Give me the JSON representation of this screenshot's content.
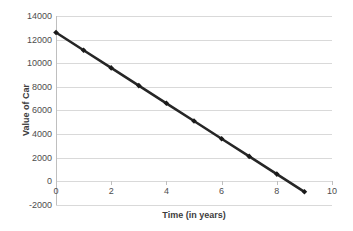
{
  "chart_data": {
    "type": "line",
    "title": "",
    "xlabel": "Time (in years)",
    "ylabel": "Value of Car",
    "x": [
      0,
      1,
      2,
      3,
      4,
      5,
      6,
      7,
      8,
      9
    ],
    "values": [
      12600,
      11100,
      9600,
      8100,
      6600,
      5100,
      3600,
      2100,
      600,
      -900
    ],
    "series": [
      {
        "name": "Value of Car",
        "x": [
          0,
          1,
          2,
          3,
          4,
          5,
          6,
          7,
          8,
          9
        ],
        "values": [
          12600,
          11100,
          9600,
          8100,
          6600,
          5100,
          3600,
          2100,
          600,
          -900
        ]
      }
    ],
    "xlim": [
      0,
      10
    ],
    "ylim": [
      -2000,
      14000
    ],
    "xticks": [
      0,
      2,
      4,
      6,
      8,
      10
    ],
    "yticks": [
      -2000,
      0,
      2000,
      4000,
      6000,
      8000,
      10000,
      12000,
      14000
    ],
    "xtick_labels": [
      "0",
      "2",
      "4",
      "6",
      "8",
      "10"
    ],
    "ytick_labels": [
      "-2000",
      "0",
      "2000",
      "4000",
      "6000",
      "8000",
      "10000",
      "12000",
      "14000"
    ],
    "grid": "horizontal",
    "legend": "none",
    "line_color": "#262626",
    "marker": "diamond",
    "marker_color": "#1a1a1a",
    "gridline_color": "#d9d9d9",
    "axis_color": "#bfbfbf",
    "background": "#ffffff",
    "annotations": []
  }
}
